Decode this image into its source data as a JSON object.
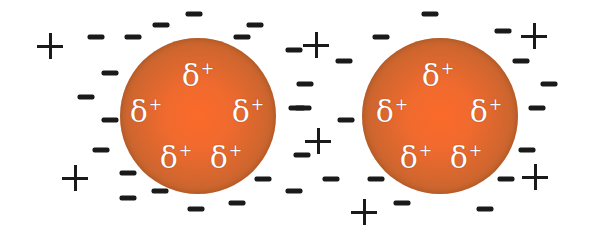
{
  "diagram": {
    "colors": {
      "particle_core": "#fb6a2a",
      "particle_edge": "#a8582a",
      "label": "#ffffff",
      "ion": "#1a1a1a",
      "background": "#ffffff"
    },
    "particles": [
      {
        "name": "left",
        "cx": 198,
        "cy": 116,
        "r": 78,
        "labels": [
          {
            "text": "δ",
            "sup": "+",
            "x": 198,
            "y": 76
          },
          {
            "text": "δ",
            "sup": "+",
            "x": 146,
            "y": 112
          },
          {
            "text": "δ",
            "sup": "+",
            "x": 248,
            "y": 112
          },
          {
            "text": "δ",
            "sup": "+",
            "x": 176,
            "y": 158
          },
          {
            "text": "δ",
            "sup": "+",
            "x": 226,
            "y": 158
          }
        ]
      },
      {
        "name": "right",
        "cx": 440,
        "cy": 116,
        "r": 78,
        "labels": [
          {
            "text": "δ",
            "sup": "+",
            "x": 438,
            "y": 76
          },
          {
            "text": "δ",
            "sup": "+",
            "x": 392,
            "y": 112
          },
          {
            "text": "δ",
            "sup": "+",
            "x": 486,
            "y": 112
          },
          {
            "text": "δ",
            "sup": "+",
            "x": 416,
            "y": 158
          },
          {
            "text": "δ",
            "sup": "+",
            "x": 466,
            "y": 158
          }
        ]
      }
    ],
    "negative_ions": [
      [
        96,
        37
      ],
      [
        133,
        37
      ],
      [
        161,
        25
      ],
      [
        194,
        14
      ],
      [
        255,
        25
      ],
      [
        242,
        37
      ],
      [
        294,
        50
      ],
      [
        110,
        73
      ],
      [
        86,
        97
      ],
      [
        110,
        120
      ],
      [
        101,
        150
      ],
      [
        128,
        173
      ],
      [
        128,
        198
      ],
      [
        160,
        191
      ],
      [
        196,
        209
      ],
      [
        237,
        203
      ],
      [
        263,
        179
      ],
      [
        294,
        191
      ],
      [
        297,
        108
      ],
      [
        430,
        14
      ],
      [
        381,
        37
      ],
      [
        344,
        61
      ],
      [
        305,
        84
      ],
      [
        303,
        108
      ],
      [
        346,
        120
      ],
      [
        302,
        155
      ],
      [
        503,
        31
      ],
      [
        521,
        61
      ],
      [
        549,
        84
      ],
      [
        537,
        108
      ],
      [
        527,
        150
      ],
      [
        506,
        179
      ],
      [
        376,
        179
      ],
      [
        331,
        179
      ],
      [
        402,
        203
      ],
      [
        485,
        209
      ]
    ],
    "positive_ions": [
      [
        50,
        46
      ],
      [
        75,
        178
      ],
      [
        316,
        45
      ],
      [
        318,
        141
      ],
      [
        534,
        36
      ],
      [
        535,
        177
      ],
      [
        364,
        212
      ]
    ]
  }
}
